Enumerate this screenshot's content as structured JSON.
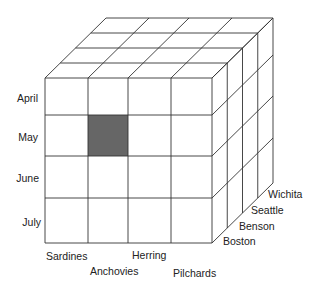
{
  "diagram": {
    "type": "data-cube",
    "dimensions": {
      "months": [
        "April",
        "May",
        "June",
        "July"
      ],
      "fish": [
        "Sardines",
        "Anchovies",
        "Herring",
        "Pilchards"
      ],
      "cities": [
        "Boston",
        "Benson",
        "Seattle",
        "Wichita"
      ]
    },
    "highlighted_cell": {
      "month": "May",
      "fish": "Anchovies",
      "city": "Boston"
    },
    "colors": {
      "line": "#333333",
      "highlight": "#666666",
      "background": "#ffffff"
    }
  },
  "labels": {
    "months": [
      "April",
      "May",
      "June",
      "July"
    ],
    "fish": [
      "Sardines",
      "Anchovies",
      "Herring",
      "Pilchards"
    ],
    "cities": [
      "Boston",
      "Benson",
      "Seattle",
      "Wichita"
    ]
  }
}
